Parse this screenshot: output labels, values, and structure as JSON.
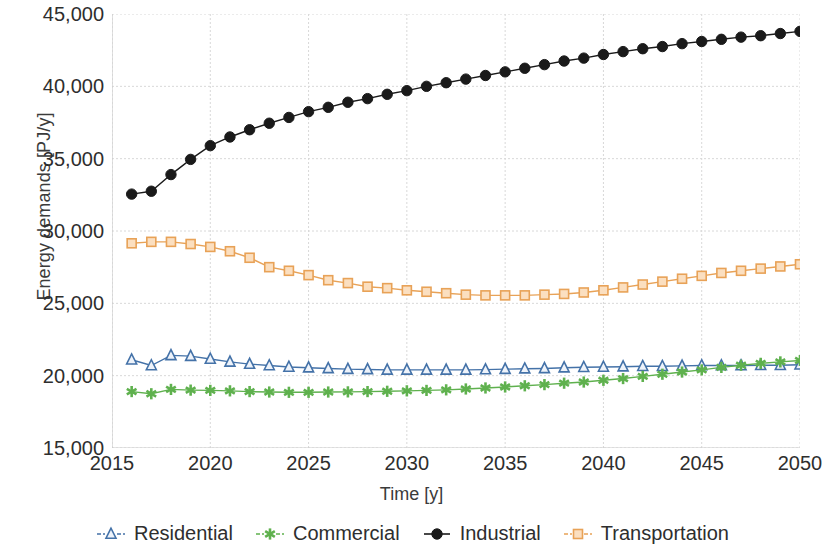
{
  "chart_data": {
    "type": "line",
    "title": "",
    "xlabel": "Time [y]",
    "ylabel": "Energy demands [PJ/y]",
    "xlim": [
      2015,
      2050
    ],
    "ylim": [
      15000,
      45000
    ],
    "xticks": [
      2015,
      2020,
      2025,
      2030,
      2035,
      2040,
      2045,
      2050
    ],
    "xtick_labels": [
      "2015",
      "2020",
      "2025",
      "2030",
      "2035",
      "2040",
      "2045",
      "2050"
    ],
    "yticks": [
      15000,
      20000,
      25000,
      30000,
      35000,
      40000,
      45000
    ],
    "ytick_labels": [
      "15,000",
      "20,000",
      "25,000",
      "30,000",
      "35,000",
      "40,000",
      "45,000"
    ],
    "grid": true,
    "legend_position": "bottom",
    "x": [
      2016,
      2017,
      2018,
      2019,
      2020,
      2021,
      2022,
      2023,
      2024,
      2025,
      2026,
      2027,
      2028,
      2029,
      2030,
      2031,
      2032,
      2033,
      2034,
      2035,
      2036,
      2037,
      2038,
      2039,
      2040,
      2041,
      2042,
      2043,
      2044,
      2045,
      2046,
      2047,
      2048,
      2049,
      2050
    ],
    "series": [
      {
        "name": "Residential",
        "color": "#4472a8",
        "marker": "triangle",
        "values": [
          21100,
          20700,
          21400,
          21350,
          21150,
          20950,
          20800,
          20700,
          20600,
          20550,
          20500,
          20450,
          20430,
          20400,
          20400,
          20400,
          20400,
          20400,
          20420,
          20450,
          20480,
          20500,
          20550,
          20580,
          20600,
          20620,
          20650,
          20650,
          20680,
          20700,
          20700,
          20700,
          20720,
          20720,
          20750
        ]
      },
      {
        "name": "Commercial",
        "color": "#5fb14e",
        "marker": "asterisk",
        "values": [
          18900,
          18750,
          19050,
          19000,
          18980,
          18950,
          18900,
          18870,
          18850,
          18850,
          18870,
          18880,
          18900,
          18920,
          18950,
          18980,
          19020,
          19080,
          19150,
          19220,
          19300,
          19380,
          19480,
          19560,
          19680,
          19800,
          19950,
          20100,
          20250,
          20400,
          20570,
          20720,
          20850,
          20950,
          21050
        ]
      },
      {
        "name": "Industrial",
        "color": "#1a1a1a",
        "marker": "circle",
        "values": [
          32550,
          32750,
          33900,
          34950,
          35900,
          36500,
          37000,
          37450,
          37850,
          38250,
          38550,
          38900,
          39150,
          39450,
          39700,
          40000,
          40250,
          40500,
          40750,
          41000,
          41250,
          41500,
          41750,
          41950,
          42200,
          42400,
          42600,
          42750,
          42950,
          43100,
          43250,
          43400,
          43500,
          43650,
          43800
        ]
      },
      {
        "name": "Transportation",
        "color": "#e8a257",
        "marker": "square",
        "values": [
          29150,
          29250,
          29250,
          29100,
          28900,
          28600,
          28150,
          27500,
          27250,
          26950,
          26600,
          26400,
          26150,
          26050,
          25900,
          25800,
          25700,
          25600,
          25550,
          25550,
          25550,
          25600,
          25650,
          25750,
          25900,
          26100,
          26300,
          26500,
          26700,
          26900,
          27100,
          27250,
          27400,
          27550,
          27700
        ]
      }
    ]
  },
  "legend": {
    "items": [
      {
        "label": "Residential"
      },
      {
        "label": "Commercial"
      },
      {
        "label": "Industrial"
      },
      {
        "label": "Transportation"
      }
    ]
  },
  "colors": {
    "residential": "#4472a8",
    "commercial": "#5fb14e",
    "industrial": "#1a1a1a",
    "transportation": "#e8a257",
    "grid": "#d8d8d8",
    "axis": "#c9c9c9",
    "text": "#2e2e2e",
    "background": "#ffffff"
  }
}
